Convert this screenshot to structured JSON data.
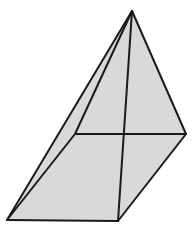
{
  "figure": {
    "shape_name": "square-based pyramid",
    "background_color": "#ffffff",
    "fill_color": "#d9d9d9",
    "fill_color_light": "#dedede",
    "edge_color": "#1a1a1a",
    "edge_width": 2,
    "canvas": {
      "width": 196,
      "height": 231
    },
    "vertices": {
      "apex": {
        "label": "apex",
        "x": 132,
        "y": 11
      },
      "right": {
        "label": "right base corner",
        "x": 186,
        "y": 134
      },
      "back": {
        "label": "back base corner",
        "x": 75,
        "y": 134
      },
      "left": {
        "label": "left base corner",
        "x": 7,
        "y": 220
      },
      "front": {
        "label": "front base corner",
        "x": 118,
        "y": 221
      },
      "center": {
        "label": "base center crossing",
        "x": 124,
        "y": 134
      }
    },
    "faces": [
      {
        "name": "left-face",
        "points": "132,11 75,134 7,220",
        "fill": "#dedede"
      },
      {
        "name": "front-left-face",
        "points": "132,11 7,220 118,221",
        "fill": "#d9d9d9"
      },
      {
        "name": "right-face",
        "points": "132,11 118,221 186,134",
        "fill": "#d9d9d9"
      }
    ],
    "edges": [
      {
        "name": "apex-to-right-edge",
        "x1": 132,
        "y1": 11,
        "x2": 186,
        "y2": 134
      },
      {
        "name": "apex-to-left-edge",
        "x1": 132,
        "y1": 11,
        "x2": 7,
        "y2": 220
      },
      {
        "name": "apex-to-back-edge",
        "x1": 132,
        "y1": 11,
        "x2": 75,
        "y2": 134
      },
      {
        "name": "apex-to-front-edge",
        "x1": 132,
        "y1": 11,
        "x2": 118,
        "y2": 221
      },
      {
        "name": "back-to-right-base-edge",
        "x1": 75,
        "y1": 134,
        "x2": 186,
        "y2": 134
      },
      {
        "name": "back-to-left-base-edge",
        "x1": 75,
        "y1": 134,
        "x2": 7,
        "y2": 220
      },
      {
        "name": "left-to-front-base-edge",
        "x1": 7,
        "y1": 220,
        "x2": 118,
        "y2": 221
      },
      {
        "name": "front-to-right-base-edge",
        "x1": 118,
        "y1": 221,
        "x2": 186,
        "y2": 134
      }
    ]
  }
}
